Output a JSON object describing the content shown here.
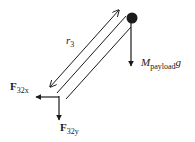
{
  "diagram": {
    "type": "free-body-diagram",
    "colors": {
      "line": "#1a1a1a",
      "background": "#ffffff"
    },
    "labels": {
      "r3": {
        "main": "r",
        "sub": "3"
      },
      "payload_weight": {
        "main": "M",
        "sub": "payload",
        "tail": "g"
      },
      "f32x": {
        "main": "F",
        "sub": "32x"
      },
      "f32y": {
        "main": "F",
        "sub": "32y"
      }
    },
    "elements": [
      {
        "id": "link",
        "description": "Link 3 drawn as two parallel lines"
      },
      {
        "id": "r3-dimension",
        "description": "Double-headed arrow indicating length r3"
      },
      {
        "id": "payload-mass",
        "description": "Point mass (black dot) at upper end of link"
      },
      {
        "id": "payload-weight-arrow",
        "description": "Downward arrow from mass: M_payload g"
      },
      {
        "id": "f32x-arrow",
        "description": "Leftward reaction force at lower joint"
      },
      {
        "id": "f32y-arrow",
        "description": "Downward reaction force at lower joint"
      }
    ]
  }
}
